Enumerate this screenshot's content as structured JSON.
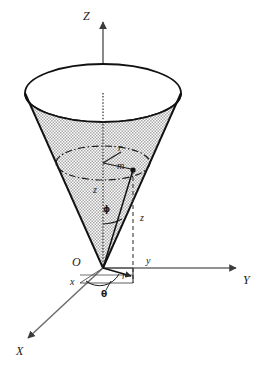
{
  "figure": {
    "background_color": "#ffffff",
    "line_color": "#1a1a1a",
    "axis_color": "#4a4a4a",
    "cone_fill_color": "#c9c9c9",
    "cone_edge_color": "#111111"
  },
  "axes": {
    "z": {
      "label": "Z",
      "x": 83,
      "y": 16
    },
    "y": {
      "label": "Y",
      "x": 243,
      "y": 281
    },
    "x": {
      "label": "X",
      "x": 16,
      "y": 352
    }
  },
  "labels": {
    "origin": {
      "text": "O",
      "x": 72,
      "y": 262
    },
    "x_small": {
      "text": "x",
      "x": 70,
      "y": 283
    },
    "y_small": {
      "text": "y",
      "x": 146,
      "y": 262
    },
    "r_base": {
      "text": "r",
      "x": 122,
      "y": 277
    },
    "theta": {
      "text": "θ",
      "x": 101,
      "y": 295
    },
    "phi": {
      "text": "ϕ",
      "x": 103,
      "y": 210
    },
    "z_axis_seg": {
      "text": "z",
      "x": 93,
      "y": 190
    },
    "z_drop_seg": {
      "text": "z",
      "x": 140,
      "y": 218
    },
    "r_upper": {
      "text": "r",
      "x": 118,
      "y": 148
    },
    "mass_point": {
      "text": "m",
      "x": 117,
      "y": 166
    }
  },
  "geometry": {
    "cone_apex": {
      "x": 103,
      "y": 268
    },
    "cone_top_ellipse": {
      "cx": 103,
      "cy": 93,
      "rx": 78,
      "ry": 29
    },
    "mid_ellipse": {
      "cx": 103,
      "cy": 163,
      "rx": 47,
      "ry": 17
    },
    "point_m": {
      "x": 133,
      "y": 170
    },
    "base_foot": {
      "x": 133,
      "y": 283
    }
  }
}
